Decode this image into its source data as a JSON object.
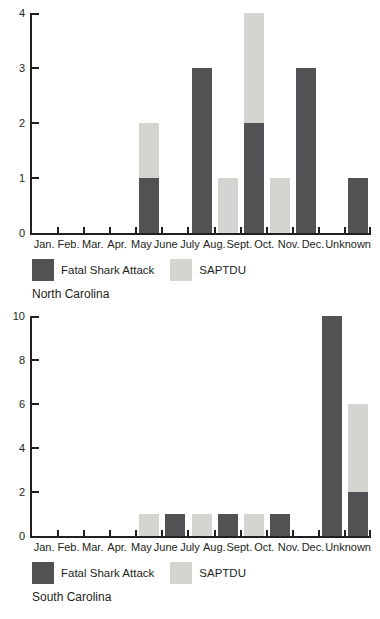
{
  "colors": {
    "fatal_shark_attack": "#525254",
    "saptdu": "#d4d4d1",
    "axis": "#231f20",
    "text": "#231f20",
    "background": "#ffffff"
  },
  "chart_data": [
    {
      "type": "bar",
      "stacked": true,
      "title": "North Carolina",
      "xlabel": "",
      "ylabel": "",
      "ylim": [
        0,
        4
      ],
      "yticks": [
        0,
        1,
        2,
        3,
        4
      ],
      "grid": false,
      "legend_position": "bottom-left",
      "categories": [
        "Jan.",
        "Feb.",
        "Mar.",
        "Apr.",
        "May",
        "June",
        "July",
        "Aug.",
        "Sept.",
        "Oct.",
        "Nov.",
        "Dec.",
        "Unknown"
      ],
      "series": [
        {
          "name": "Fatal Shark Attack",
          "values": [
            0,
            0,
            0,
            0,
            1,
            0,
            3,
            0,
            2,
            0,
            3,
            0,
            1
          ]
        },
        {
          "name": "SAPTDU",
          "values": [
            0,
            0,
            0,
            0,
            1,
            0,
            0,
            1,
            2,
            1,
            0,
            0,
            0
          ]
        }
      ],
      "legend": [
        "Fatal Shark Attack",
        "SAPTDU"
      ]
    },
    {
      "type": "bar",
      "stacked": true,
      "title": "South Carolina",
      "xlabel": "",
      "ylabel": "",
      "ylim": [
        0,
        10
      ],
      "yticks": [
        0,
        2,
        4,
        6,
        8,
        10
      ],
      "grid": false,
      "legend_position": "bottom-left",
      "categories": [
        "Jan.",
        "Feb.",
        "Mar.",
        "Apr.",
        "May",
        "June",
        "July",
        "Aug.",
        "Sept.",
        "Oct.",
        "Nov.",
        "Dec.",
        "Unknown"
      ],
      "series": [
        {
          "name": "Fatal Shark Attack",
          "values": [
            0,
            0,
            0,
            0,
            0,
            1,
            0,
            1,
            0,
            1,
            0,
            10,
            2
          ]
        },
        {
          "name": "SAPTDU",
          "values": [
            0,
            0,
            0,
            0,
            1,
            0,
            1,
            0,
            1,
            0,
            0,
            0,
            4
          ]
        }
      ],
      "legend": [
        "Fatal Shark Attack",
        "SAPTDU"
      ]
    }
  ]
}
